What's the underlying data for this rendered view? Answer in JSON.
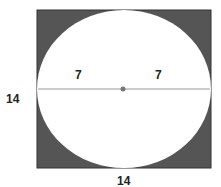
{
  "diagram": {
    "square": {
      "side_label": "14",
      "height_label": "14",
      "fill": "#555555"
    },
    "circle": {
      "fill": "#ffffff"
    },
    "radius_labels": [
      "7",
      "7"
    ],
    "diameter_line_color": "#999999",
    "center_dot_color": "#777777"
  }
}
